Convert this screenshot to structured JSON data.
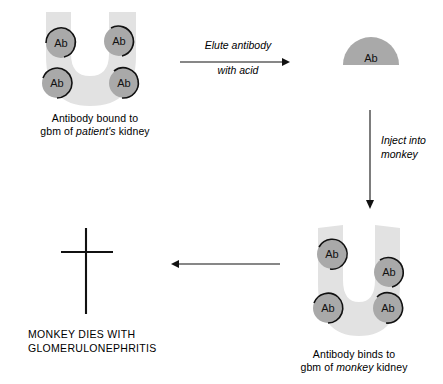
{
  "diagram": {
    "colors": {
      "kidney_fill": "#e2e2e2",
      "antibody_fill": "#a9a9a9",
      "outline": "#111111",
      "arrow": "#111111",
      "background": "#ffffff"
    },
    "antibody_label": "Ab",
    "nodes": [
      {
        "id": "patient-kidney",
        "kind": "kidney",
        "antibody_count": 4,
        "caption_line1": "Antibody bound to",
        "caption_line2_pre": "gbm of ",
        "caption_line2_em": "patient's",
        "caption_line2_post": " kidney"
      },
      {
        "id": "eluted-antibody",
        "kind": "antibody-dome",
        "label": "Ab"
      },
      {
        "id": "monkey-kidney",
        "kind": "kidney",
        "antibody_count": 4,
        "caption_line1": "Antibody binds to",
        "caption_line2_pre": "gbm of ",
        "caption_line2_em": "monkey",
        "caption_line2_post": " kidney"
      },
      {
        "id": "monkey-death",
        "kind": "cross",
        "caption_line1": "MONKEY DIES WITH",
        "caption_line2": "GLOMERULONEPHRITIS"
      }
    ],
    "arrows": [
      {
        "id": "elute-arrow",
        "direction": "right",
        "label_above": "Elute antibody",
        "label_below": "with acid"
      },
      {
        "id": "inject-arrow",
        "direction": "down",
        "label_line1": "Inject into",
        "label_line2": "monkey"
      },
      {
        "id": "outcome-arrow",
        "direction": "left",
        "label": ""
      }
    ]
  }
}
